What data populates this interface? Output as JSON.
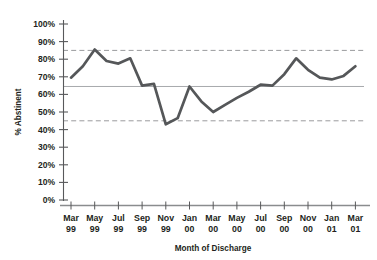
{
  "chart_data": {
    "type": "line",
    "title": "",
    "xlabel": "Month of Discharge",
    "ylabel": "% Abstinent",
    "ylim": [
      0,
      100
    ],
    "ytick_labels": [
      "0%",
      "10%",
      "20%",
      "30%",
      "40%",
      "50%",
      "60%",
      "70%",
      "80%",
      "90%",
      "100%"
    ],
    "ytick_values": [
      0,
      10,
      20,
      30,
      40,
      50,
      60,
      70,
      80,
      90,
      100
    ],
    "xtick_labels": [
      "Mar\n99",
      "May\n99",
      "Jul\n99",
      "Sep\n99",
      "Nov\n99",
      "Jan\n00",
      "Mar\n00",
      "May\n00",
      "Jul\n00",
      "Sep\n00",
      "Nov\n00",
      "Jan\n01",
      "Mar\n01"
    ],
    "xtick_labels_top": [
      "Mar",
      "May",
      "Jul",
      "Sep",
      "Nov",
      "Jan",
      "Mar",
      "May",
      "Jul",
      "Sep",
      "Nov",
      "Jan",
      "Mar"
    ],
    "xtick_labels_bottom": [
      "99",
      "99",
      "99",
      "99",
      "99",
      "00",
      "00",
      "00",
      "00",
      "00",
      "00",
      "01",
      "01"
    ],
    "grid": false,
    "legend": "none",
    "x_months": [
      "Mar 99",
      "Apr 99",
      "May 99",
      "Jun 99",
      "Jul 99",
      "Aug 99",
      "Sep 99",
      "Oct 99",
      "Nov 99",
      "Dec 99",
      "Jan 00",
      "Feb 00",
      "Mar 00",
      "Apr 00",
      "May 00",
      "Jun 00",
      "Jul 00",
      "Aug 00",
      "Sep 00",
      "Oct 00",
      "Nov 00",
      "Dec 00",
      "Jan 01",
      "Feb 01",
      "Mar 01"
    ],
    "series": [
      {
        "name": "% Abstinent",
        "color": "#555759",
        "values": [
          69.5,
          76.0,
          85.5,
          79.0,
          77.5,
          80.5,
          65.0,
          66.0,
          43.0,
          46.5,
          64.5,
          56.0,
          50.0,
          54.0,
          58.0,
          61.5,
          65.5,
          65.0,
          71.5,
          80.5,
          74.0,
          69.5,
          68.5,
          70.5,
          76.0
        ]
      }
    ],
    "reference_lines": [
      {
        "name": "upper-control-limit",
        "value": 85.0,
        "style": "dashed",
        "color": "#9a9b9d"
      },
      {
        "name": "center-line",
        "value": 64.5,
        "style": "solid",
        "color": "#a7a9ac"
      },
      {
        "name": "lower-control-limit",
        "value": 45.0,
        "style": "dashed",
        "color": "#9a9b9d"
      }
    ]
  }
}
